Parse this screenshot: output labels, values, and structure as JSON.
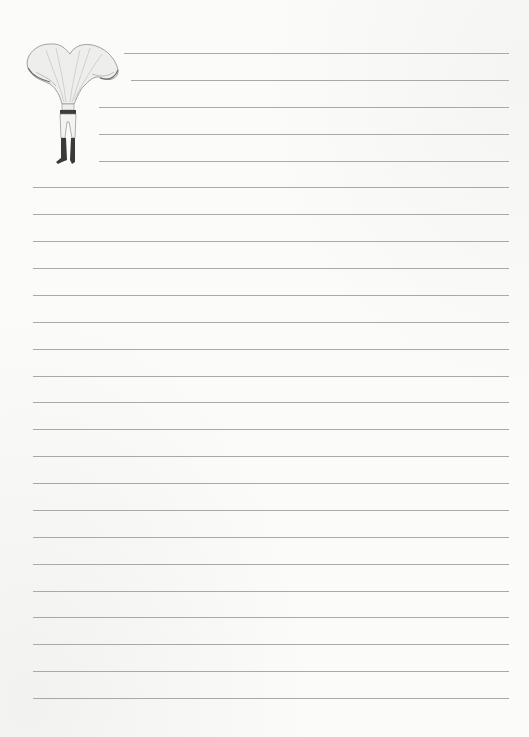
{
  "page": {
    "type": "lined stationery sheet",
    "background_color": "#fbfbfa",
    "line_color": "#a9a9a6"
  },
  "illustration": {
    "subject": "mushroom-headed figure",
    "icon": "mushroom-person-icon"
  },
  "rules": {
    "first_y": 53,
    "spacing": 26.875,
    "right_x": 509,
    "lines": [
      {
        "x": 124
      },
      {
        "x": 131
      },
      {
        "x": 99
      },
      {
        "x": 99
      },
      {
        "x": 99
      },
      {
        "x": 33
      },
      {
        "x": 33
      },
      {
        "x": 33
      },
      {
        "x": 33
      },
      {
        "x": 33
      },
      {
        "x": 33
      },
      {
        "x": 33
      },
      {
        "x": 33
      },
      {
        "x": 33
      },
      {
        "x": 33
      },
      {
        "x": 33
      },
      {
        "x": 33
      },
      {
        "x": 33
      },
      {
        "x": 33
      },
      {
        "x": 33
      },
      {
        "x": 33
      },
      {
        "x": 33
      },
      {
        "x": 33
      },
      {
        "x": 33
      },
      {
        "x": 33
      }
    ]
  }
}
